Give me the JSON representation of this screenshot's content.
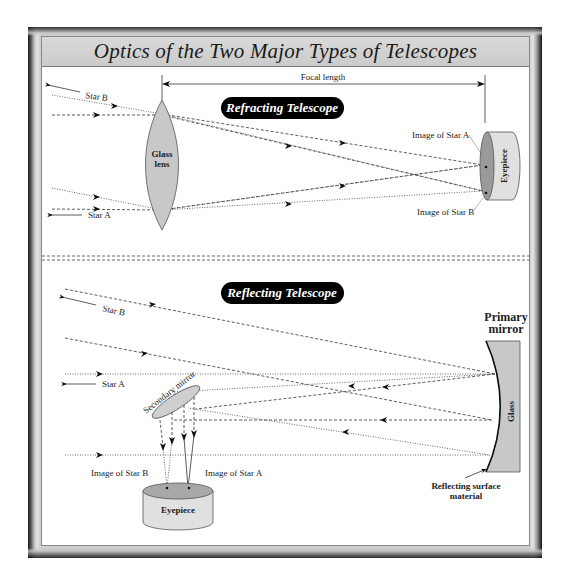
{
  "title": "Optics of the Two Major Types of Telescopes",
  "refracting": {
    "heading": "Refracting Telescope",
    "focal_length_label": "Focal length",
    "lens_label_line1": "Glass",
    "lens_label_line2": "lens",
    "star_b_label": "Star B",
    "star_a_label": "Star A",
    "image_a_label": "Image of Star A",
    "image_b_label": "Image of Star B",
    "eyepiece_label": "Eyepiece"
  },
  "reflecting": {
    "heading": "Reflecting Telescope",
    "star_b_label": "Star B",
    "star_a_label": "Star A",
    "secondary_mirror_label": "Secondary mirror",
    "primary_mirror_line1": "Primary",
    "primary_mirror_line2": "mirror",
    "glass_label": "Glass",
    "reflecting_surface_line1": "Reflecting surface",
    "reflecting_surface_line2": "material",
    "image_b_label": "Image of Star B",
    "image_a_label": "Image of Star A",
    "eyepiece_label": "Eyepiece"
  },
  "colors": {
    "frame_dark": "#1a1a1a",
    "title_bar": "#cfcfcf",
    "glass_fill": "#c8c8c8",
    "pill": "#000000"
  }
}
